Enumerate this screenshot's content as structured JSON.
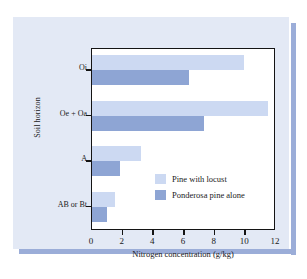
{
  "chart_data": {
    "type": "bar",
    "orientation": "horizontal",
    "title": "",
    "xlabel": "Nitrogen concentration (g/kg)",
    "ylabel": "Soil horizon",
    "categories": [
      "Oi",
      "Oe + Oa",
      "A",
      "AB or Bt"
    ],
    "series": [
      {
        "name": "Pine with locust",
        "color": "#ccd9f2",
        "values": [
          9.9,
          11.5,
          3.2,
          1.5
        ]
      },
      {
        "name": "Ponderosa pine alone",
        "color": "#8ea5d4",
        "values": [
          6.3,
          7.3,
          1.8,
          1.0
        ]
      }
    ],
    "xlim": [
      0,
      12
    ],
    "xticks": [
      0,
      2,
      4,
      6,
      8,
      10,
      12
    ],
    "xtick_labels": [
      "0",
      "2",
      "4",
      "6",
      "8",
      "10",
      "12"
    ],
    "grid": false,
    "legend_position": "middle-right-inside"
  },
  "figure": {
    "panel_color": "#e3e9f5",
    "shadow_color": "#9badd8",
    "plot_background": "#ffffff",
    "frame_color": "#141414"
  }
}
